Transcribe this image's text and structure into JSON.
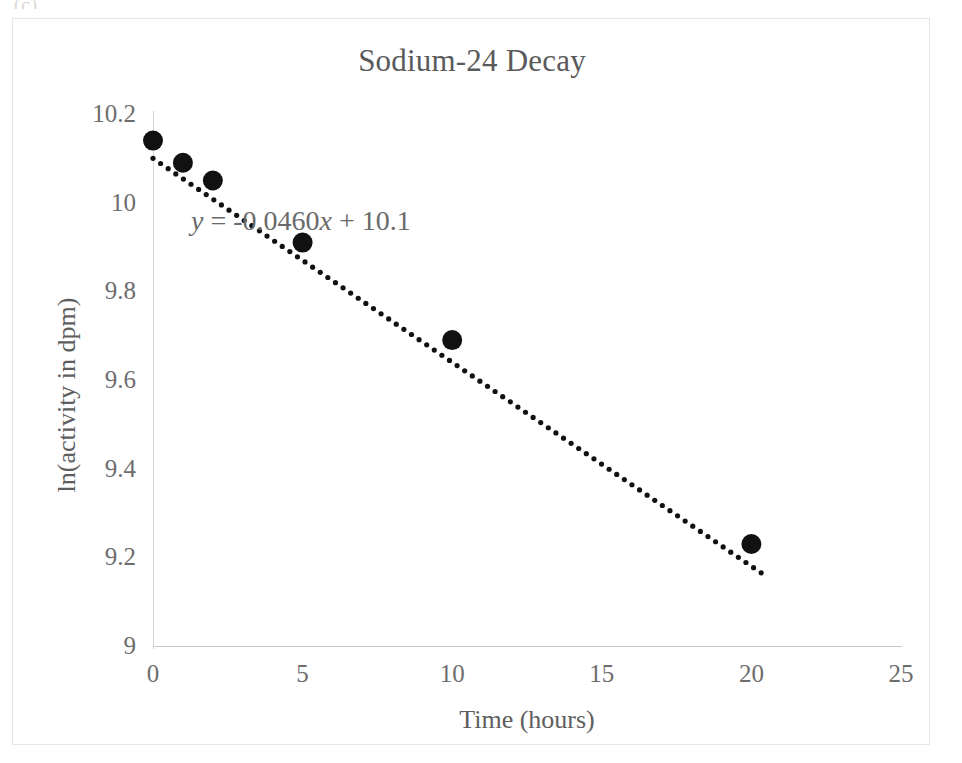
{
  "page": {
    "artifact_text": "(c)"
  },
  "chart_data": {
    "type": "scatter",
    "title": "Sodium-24 Decay",
    "xlabel": "Time (hours)",
    "ylabel": "ln(activity in dpm)",
    "x": [
      0,
      1,
      2,
      5,
      10,
      20
    ],
    "values": [
      10.14,
      10.09,
      10.05,
      9.91,
      9.69,
      9.23
    ],
    "series": [
      {
        "name": "Sodium-24 Decay",
        "x": [
          0,
          1,
          2,
          5,
          10,
          20
        ],
        "values": [
          10.14,
          10.09,
          10.05,
          9.91,
          9.69,
          9.23
        ]
      }
    ],
    "xlim": [
      0,
      25
    ],
    "ylim": [
      9,
      10.2
    ],
    "xticks": [
      "0",
      "5",
      "10",
      "15",
      "20",
      "25"
    ],
    "xtick_values": [
      0,
      5,
      10,
      15,
      20,
      25
    ],
    "yticks": [
      "9",
      "9.2",
      "9.4",
      "9.6",
      "9.8",
      "10",
      "10.2"
    ],
    "ytick_values": [
      9,
      9.2,
      9.4,
      9.6,
      9.8,
      10,
      10.2
    ],
    "grid": false,
    "legend": "none",
    "trendline": {
      "type": "linear-dotted",
      "slope": -0.046,
      "intercept": 10.1,
      "equation_prefix": "y",
      "equation_body": " = -0.0460",
      "equation_var": "x",
      "equation_suffix": " + 10.1",
      "equation_full": "y = -0.0460x + 10.1",
      "x_start": 0,
      "x_end": 20.4
    },
    "colors": {
      "marker": "#111111",
      "trendline": "#111111",
      "axis": "#c9c9c9",
      "text": "#5e5e5e",
      "frame": "#e6e6e6",
      "background": "#ffffff"
    }
  }
}
